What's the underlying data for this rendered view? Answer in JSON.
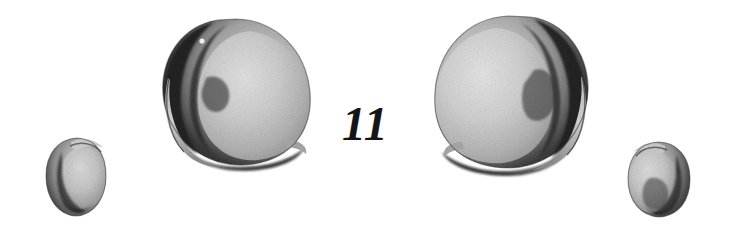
{
  "plate": {
    "width": 732,
    "height": 237,
    "background_color": "#ffffff",
    "medium": "engraved halftone plate",
    "figure_number": "11",
    "figure_number_color": "#151515",
    "figure_number_style": "italic serif",
    "figure_number_x": 342,
    "figure_number_y": 100,
    "figure_number_font_size": 48
  },
  "palette": {
    "paper": "#ffffff",
    "ink_darkest": "#1c1c1c",
    "ink_dark": "#2e2e2e",
    "ink_mid": "#5c5c5c",
    "ink_light": "#9a9a9a",
    "ink_pale": "#c4c4c4",
    "ink_palest": "#dcdcdc",
    "highlight": "#f2f2f2",
    "outline": "#3a3a3a"
  },
  "specimens": [
    {
      "id": "specimen-1",
      "label": "small shell left",
      "size": "small",
      "orientation": "left-facing",
      "shade_side": "left",
      "cx": 76,
      "cy": 176,
      "rx": 29,
      "ry": 33,
      "bounds": {
        "x": 47,
        "y": 137,
        "w": 58,
        "h": 79
      },
      "lip_notch": "upper-right"
    },
    {
      "id": "specimen-2",
      "label": "large shell left",
      "size": "large",
      "orientation": "left-facing",
      "shade_side": "left",
      "cx": 234,
      "cy": 90,
      "rx": 76,
      "ry": 74,
      "bounds": {
        "x": 158,
        "y": 18,
        "w": 152,
        "h": 150
      },
      "lip_notch": "bottom",
      "highlight_dot": {
        "x": 202,
        "y": 41,
        "r": 3
      }
    },
    {
      "id": "specimen-3",
      "label": "large shell right",
      "size": "large",
      "orientation": "right-facing",
      "shade_side": "right",
      "cx": 512,
      "cy": 93,
      "rx": 78,
      "ry": 76,
      "bounds": {
        "x": 434,
        "y": 16,
        "w": 158,
        "h": 158
      },
      "lip_notch": "bottom"
    },
    {
      "id": "specimen-4",
      "label": "small shell right",
      "size": "small",
      "orientation": "right-facing",
      "shade_side": "right",
      "cx": 659,
      "cy": 178,
      "rx": 31,
      "ry": 34,
      "bounds": {
        "x": 628,
        "y": 141,
        "w": 62,
        "h": 75
      },
      "lip_notch": "upper-left"
    }
  ]
}
